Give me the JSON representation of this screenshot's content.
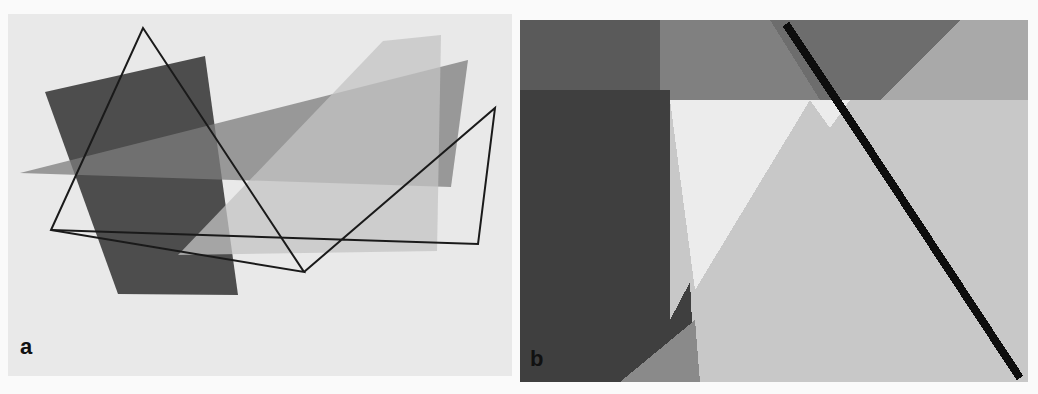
{
  "figure": {
    "panels": [
      {
        "id": "a",
        "label": "a",
        "description": "Overlapping semi-transparent polygons with an outlined triangle"
      },
      {
        "id": "b",
        "label": "b",
        "description": "Magnified pixelated view of overlapping region showing aliasing"
      }
    ],
    "colors": {
      "background_a": "#e9e9e9",
      "dark_quad": "#4a4a4a",
      "mid_triangle": "#8c8c8c",
      "light_shape": "#c8c8c8",
      "outline": "#1a1a1a"
    }
  }
}
